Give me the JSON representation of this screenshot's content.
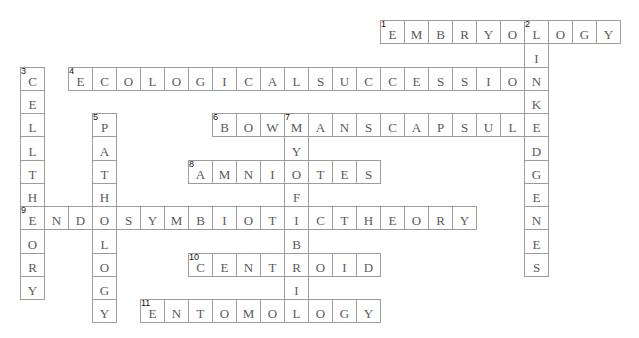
{
  "puzzle": {
    "words": [
      {
        "number": "1",
        "direction": "across",
        "letters": [
          "E",
          "M",
          "B",
          "R",
          "Y",
          "O",
          "L",
          "O",
          "G",
          "Y"
        ]
      },
      {
        "number": "2",
        "direction": "down",
        "letters": [
          "L",
          "I",
          "N",
          "K",
          "E",
          "D",
          "G",
          "E",
          "N",
          "E",
          "S"
        ]
      },
      {
        "number": "3",
        "direction": "down",
        "letters": [
          "C",
          "E",
          "L",
          "L",
          "T",
          "H",
          "E",
          "O",
          "R",
          "Y"
        ]
      },
      {
        "number": "4",
        "direction": "across",
        "letters": [
          "E",
          "C",
          "O",
          "L",
          "O",
          "G",
          "I",
          "C",
          "A",
          "L",
          "S",
          "U",
          "C",
          "C",
          "E",
          "S",
          "S",
          "I",
          "O",
          "N"
        ]
      },
      {
        "number": "5",
        "direction": "down",
        "letters": [
          "P",
          "A",
          "T",
          "H",
          "O",
          "L",
          "O",
          "G",
          "Y"
        ]
      },
      {
        "number": "6",
        "direction": "across",
        "letters": [
          "B",
          "O",
          "W",
          "M",
          "A",
          "N",
          "S",
          "C",
          "A",
          "P",
          "S",
          "U",
          "L",
          "E"
        ]
      },
      {
        "number": "7",
        "direction": "down",
        "letters": [
          "M",
          "Y",
          "O",
          "F",
          "I",
          "B",
          "R",
          "I",
          "L"
        ]
      },
      {
        "number": "8",
        "direction": "across",
        "letters": [
          "A",
          "M",
          "N",
          "I",
          "O",
          "T",
          "E",
          "S"
        ]
      },
      {
        "number": "9",
        "direction": "across",
        "letters": [
          "E",
          "N",
          "D",
          "O",
          "S",
          "Y",
          "M",
          "B",
          "I",
          "O",
          "T",
          "I",
          "C",
          "T",
          "H",
          "E",
          "O",
          "R",
          "Y"
        ]
      },
      {
        "number": "10",
        "direction": "across",
        "letters": [
          "C",
          "E",
          "N",
          "T",
          "R",
          "O",
          "I",
          "D"
        ]
      },
      {
        "number": "11",
        "direction": "across",
        "letters": [
          "E",
          "N",
          "T",
          "O",
          "M",
          "O",
          "L",
          "O",
          "G",
          "Y"
        ]
      }
    ]
  }
}
